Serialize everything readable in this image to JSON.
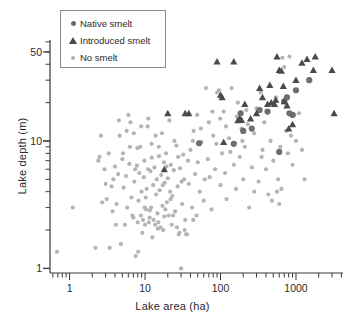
{
  "chart_data": {
    "type": "scatter",
    "title": "",
    "xlabel": "Lake area (ha)",
    "ylabel": "Lake depth (m)",
    "xscale": "log",
    "yscale": "log",
    "xlim": [
      0.55,
      4200
    ],
    "ylim": [
      0.92,
      62
    ],
    "grid": false,
    "xticks": [
      1,
      10,
      100,
      1000
    ],
    "xticklabels": [
      "1",
      "10",
      "100",
      "1000"
    ],
    "yticks": [
      1,
      10,
      50
    ],
    "yticklabels": [
      "1",
      "10",
      "50"
    ],
    "legend_position": "upper-left",
    "legend_entries": [
      {
        "label": "Native smelt",
        "marker": "circle",
        "color": "#6d6d6d",
        "size": 5
      },
      {
        "label": "Introduced smelt",
        "marker": "triangle",
        "color": "#4a4a4a",
        "size": 6
      },
      {
        "label": "No smelt",
        "marker": "circle",
        "color": "#b4b4b4",
        "size": 4
      }
    ],
    "series": [
      {
        "name": "Native smelt",
        "marker": "circle",
        "color": "#6d6d6d",
        "points": [
          [
            52,
            9.6
          ],
          [
            150,
            9.5
          ],
          [
            200,
            12.0
          ],
          [
            330,
            17.5
          ],
          [
            420,
            17.0
          ],
          [
            600,
            8.2
          ],
          [
            700,
            20.5
          ],
          [
            820,
            16.5
          ],
          [
            900,
            16.0
          ],
          [
            1000,
            25.0
          ],
          [
            1500,
            30.0
          ],
          [
            185,
            16.5
          ],
          [
            260,
            12.5
          ],
          [
            760,
            22.0
          ]
        ]
      },
      {
        "name": "Introduced smelt",
        "marker": "triangle",
        "color": "#4a4a4a",
        "points": [
          [
            18,
            6.0
          ],
          [
            20,
            16.5
          ],
          [
            34,
            16.5
          ],
          [
            38,
            16.5
          ],
          [
            90,
            42.0
          ],
          [
            100,
            23.0
          ],
          [
            105,
            22.0
          ],
          [
            110,
            9.8
          ],
          [
            150,
            42.0
          ],
          [
            170,
            14.5
          ],
          [
            180,
            15.0
          ],
          [
            190,
            14.6
          ],
          [
            210,
            19.5
          ],
          [
            300,
            16.5
          ],
          [
            330,
            26.0
          ],
          [
            360,
            22.0
          ],
          [
            420,
            19.5
          ],
          [
            450,
            27.5
          ],
          [
            470,
            20.0
          ],
          [
            520,
            19.5
          ],
          [
            560,
            46.0
          ],
          [
            600,
            36.0
          ],
          [
            640,
            35.5
          ],
          [
            680,
            27.0
          ],
          [
            700,
            20.5
          ],
          [
            760,
            19.0
          ],
          [
            800,
            12.5
          ],
          [
            900,
            13.5
          ],
          [
            1000,
            30.0
          ],
          [
            1200,
            41.0
          ],
          [
            1400,
            44.0
          ],
          [
            1700,
            36.0
          ],
          [
            1800,
            46.0
          ],
          [
            3000,
            36.0
          ],
          [
            3200,
            16.5
          ],
          [
            250,
            15.0
          ],
          [
            540,
            21.0
          ]
        ]
      },
      {
        "name": "No smelt",
        "marker": "circle",
        "color": "#b4b4b4",
        "points": [
          [
            0.68,
            1.35
          ],
          [
            1.1,
            3.0
          ],
          [
            2.2,
            1.45
          ],
          [
            2.4,
            7.0
          ],
          [
            2.5,
            7.5
          ],
          [
            2.6,
            11.0
          ],
          [
            2.7,
            3.3
          ],
          [
            2.9,
            6.0
          ],
          [
            3.0,
            4.6
          ],
          [
            3.1,
            3.5
          ],
          [
            3.4,
            1.45
          ],
          [
            3.6,
            4.4
          ],
          [
            3.8,
            5.0
          ],
          [
            4.0,
            6.3
          ],
          [
            4.2,
            3.2
          ],
          [
            4.4,
            5.5
          ],
          [
            4.6,
            11.0
          ],
          [
            4.8,
            1.55
          ],
          [
            5.0,
            7.2
          ],
          [
            5.2,
            4.3
          ],
          [
            5.4,
            2.2
          ],
          [
            5.6,
            5.3
          ],
          [
            5.8,
            3.0
          ],
          [
            6.0,
            16.0
          ],
          [
            6.2,
            6.6
          ],
          [
            6.4,
            14.0
          ],
          [
            6.6,
            3.6
          ],
          [
            6.8,
            2.6
          ],
          [
            7.0,
            2.5
          ],
          [
            7.2,
            4.8
          ],
          [
            7.4,
            6.0
          ],
          [
            7.5,
            1.25
          ],
          [
            7.8,
            6.4
          ],
          [
            8.0,
            2.3
          ],
          [
            8.2,
            3.4
          ],
          [
            8.4,
            5.6
          ],
          [
            8.6,
            9.0
          ],
          [
            8.8,
            2.6
          ],
          [
            9.0,
            4.0
          ],
          [
            9.2,
            1.9
          ],
          [
            9.4,
            2.4
          ],
          [
            9.6,
            5.2
          ],
          [
            9.8,
            7.0
          ],
          [
            10.0,
            2.2
          ],
          [
            10.2,
            3.6
          ],
          [
            10.5,
            4.2
          ],
          [
            10.8,
            13.0
          ],
          [
            11.0,
            6.0
          ],
          [
            11.2,
            2.3
          ],
          [
            11.5,
            2.5
          ],
          [
            11.8,
            5.8
          ],
          [
            12.0,
            3.0
          ],
          [
            12.2,
            9.5
          ],
          [
            12.5,
            1.75
          ],
          [
            12.8,
            4.5
          ],
          [
            13.0,
            2.4
          ],
          [
            13.3,
            6.2
          ],
          [
            13.6,
            2.2
          ],
          [
            14.0,
            3.8
          ],
          [
            14.3,
            5.0
          ],
          [
            14.6,
            2.7
          ],
          [
            15.0,
            2.3
          ],
          [
            15.3,
            7.6
          ],
          [
            15.6,
            4.1
          ],
          [
            16.0,
            2.1
          ],
          [
            16.4,
            5.4
          ],
          [
            16.8,
            11.5
          ],
          [
            17.0,
            3.1
          ],
          [
            17.4,
            2.0
          ],
          [
            17.8,
            6.8
          ],
          [
            18.2,
            4.7
          ],
          [
            18.6,
            2.9
          ],
          [
            19.0,
            8.0
          ],
          [
            19.5,
            3.3
          ],
          [
            20.0,
            5.1
          ],
          [
            20.5,
            2.6
          ],
          [
            21.0,
            14.5
          ],
          [
            21.5,
            4.0
          ],
          [
            22.0,
            6.5
          ],
          [
            22.5,
            2.2
          ],
          [
            23.0,
            3.7
          ],
          [
            24.0,
            5.9
          ],
          [
            25.0,
            2.8
          ],
          [
            26.0,
            9.2
          ],
          [
            27.0,
            4.4
          ],
          [
            28.0,
            1.85
          ],
          [
            29.0,
            6.1
          ],
          [
            30.0,
            1.0
          ],
          [
            31.0,
            3.2
          ],
          [
            32.0,
            7.8
          ],
          [
            33.0,
            5.0
          ],
          [
            34.0,
            2.4
          ],
          [
            36.0,
            1.85
          ],
          [
            38.0,
            4.6
          ],
          [
            40.0,
            8.5
          ],
          [
            42.0,
            3.0
          ],
          [
            44.0,
            12.0
          ],
          [
            46.0,
            5.5
          ],
          [
            48.0,
            2.6
          ],
          [
            50.0,
            6.8
          ],
          [
            53.0,
            4.0
          ],
          [
            56.0,
            9.8
          ],
          [
            60.0,
            3.4
          ],
          [
            64.0,
            26.0
          ],
          [
            68.0,
            7.2
          ],
          [
            72.0,
            5.2
          ],
          [
            76.0,
            2.9
          ],
          [
            80.0,
            11.0
          ],
          [
            85.0,
            6.0
          ],
          [
            90.0,
            24.0
          ],
          [
            95.0,
            25.0
          ],
          [
            100.0,
            4.5
          ],
          [
            105.0,
            8.0
          ],
          [
            110.0,
            17.0
          ],
          [
            115.0,
            5.6
          ],
          [
            120.0,
            3.5
          ],
          [
            130.0,
            10.5
          ],
          [
            140.0,
            26.0
          ],
          [
            150.0,
            6.5
          ],
          [
            160.0,
            4.2
          ],
          [
            170.0,
            20.0
          ],
          [
            180.0,
            7.5
          ],
          [
            190.0,
            12.5
          ],
          [
            200.0,
            5.0
          ],
          [
            210.0,
            9.0
          ],
          [
            220.0,
            17.5
          ],
          [
            240.0,
            3.0
          ],
          [
            260.0,
            6.2
          ],
          [
            280.0,
            11.5
          ],
          [
            300.0,
            18.0
          ],
          [
            320.0,
            4.8
          ],
          [
            340.0,
            24.0
          ],
          [
            360.0,
            8.5
          ],
          [
            380.0,
            14.0
          ],
          [
            400.0,
            6.0
          ],
          [
            430.0,
            3.8
          ],
          [
            460.0,
            10.0
          ],
          [
            500.0,
            7.0
          ],
          [
            540.0,
            22.0
          ],
          [
            580.0,
            5.0
          ],
          [
            620.0,
            9.0
          ],
          [
            660.0,
            45.0
          ],
          [
            700.0,
            38.0
          ],
          [
            740.0,
            12.0
          ],
          [
            780.0,
            8.0
          ],
          [
            820.0,
            46.0
          ],
          [
            860.0,
            11.0
          ],
          [
            900.0,
            6.5
          ],
          [
            950.0,
            16.0
          ],
          [
            1000.0,
            10.0
          ],
          [
            1100.0,
            16.5
          ],
          [
            1200.0,
            8.5
          ],
          [
            1300.0,
            5.0
          ],
          [
            600.0,
            3.2
          ],
          [
            640.0,
            4.2
          ],
          [
            560.0,
            4.0
          ],
          [
            480.0,
            3.4
          ],
          [
            350.0,
            7.5
          ],
          [
            280.0,
            4.0
          ],
          [
            230.0,
            13.5
          ],
          [
            195.0,
            10.0
          ],
          [
            165.0,
            15.5
          ],
          [
            135.0,
            8.2
          ],
          [
            118.0,
            13.0
          ],
          [
            99.0,
            15.0
          ],
          [
            88.0,
            9.5
          ],
          [
            78.0,
            17.0
          ],
          [
            70.0,
            14.0
          ],
          [
            62.0,
            5.0
          ],
          [
            55.0,
            12.5
          ],
          [
            49.0,
            16.0
          ],
          [
            43.0,
            10.0
          ],
          [
            37.0,
            7.0
          ],
          [
            33.5,
            2.0
          ],
          [
            30.5,
            4.8
          ],
          [
            27.5,
            7.5
          ],
          [
            24.5,
            10.0
          ],
          [
            21.8,
            3.5
          ],
          [
            19.2,
            6.3
          ],
          [
            17.2,
            4.5
          ],
          [
            15.2,
            9.0
          ],
          [
            13.8,
            11.0
          ],
          [
            12.3,
            7.4
          ],
          [
            11.0,
            15.0
          ],
          [
            9.9,
            3.0
          ],
          [
            8.9,
            13.0
          ],
          [
            7.9,
            8.8
          ],
          [
            7.1,
            11.5
          ],
          [
            6.3,
            9.0
          ],
          [
            5.7,
            12.0
          ],
          [
            5.1,
            8.0
          ],
          [
            4.5,
            14.5
          ],
          [
            4.1,
            2.2
          ],
          [
            3.7,
            2.8
          ],
          [
            3.3,
            8.0
          ],
          [
            8.1,
            1.35
          ],
          [
            14.8,
            2.05
          ],
          [
            26.5,
            2.1
          ],
          [
            28.5,
            1.9
          ],
          [
            35.0,
            1.85
          ],
          [
            43.5,
            2.4
          ],
          [
            11.6,
            2.85
          ],
          [
            10.3,
            2.9
          ],
          [
            23.5,
            2.6
          ],
          [
            18.0,
            2.55
          ]
        ]
      }
    ]
  }
}
